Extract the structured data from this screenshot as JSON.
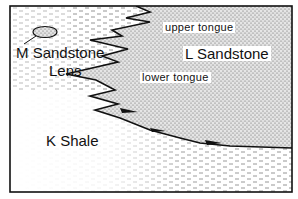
{
  "diagram": {
    "type": "geologic cross-section (facies change)",
    "units": {
      "k_shale": {
        "label": "K  Shale",
        "pattern": "dashes"
      },
      "l_sandstone": {
        "label": "L  Sandstone",
        "pattern": "stipple"
      },
      "m_sandstone_lens": {
        "label_line1": "M  Sandstone",
        "label_line2": "Lens",
        "pattern": "stipple"
      }
    },
    "tongues": {
      "upper": "upper  tongue",
      "lower": "lower  tongue"
    },
    "colors": {
      "ink": "#111111",
      "background": "#ffffff"
    }
  }
}
